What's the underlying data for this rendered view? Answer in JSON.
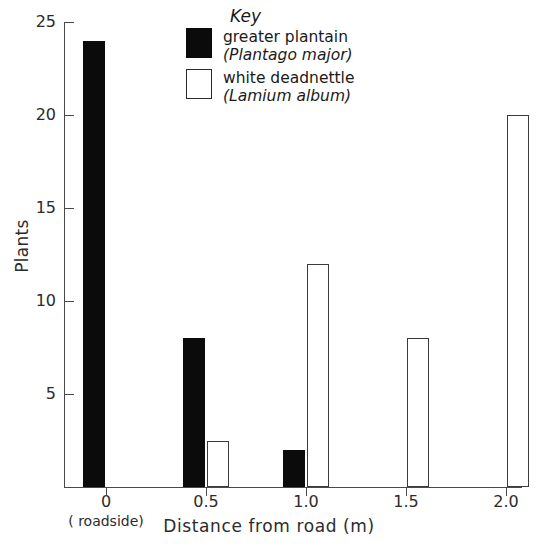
{
  "chart_data": {
    "type": "bar",
    "title": "",
    "xlabel": "Distance from road (m)",
    "ylabel": "Plants",
    "categories": [
      "0",
      "0.5",
      "1.0",
      "1.5",
      "2.0"
    ],
    "x_tick_labels": [
      "0",
      "0.5",
      "1.0",
      "1.5",
      "2.0"
    ],
    "x_axis_note": "( roadside)",
    "y_tick_labels": [
      "5",
      "10",
      "15",
      "20",
      "25"
    ],
    "y_ticks": [
      5,
      10,
      15,
      20,
      25
    ],
    "ylim": [
      0,
      25
    ],
    "grid": false,
    "legend_position": "top-center",
    "series": [
      {
        "name": "greater plantain",
        "latin": "(Plantago major)",
        "fill": "#0b0b0b",
        "style": "filled",
        "values": [
          24,
          8,
          2,
          0,
          0
        ]
      },
      {
        "name": "white deadnettle",
        "latin": "(Lamium album)",
        "fill": "#ffffff",
        "style": "open",
        "values": [
          0,
          2.5,
          12,
          8,
          20
        ]
      }
    ]
  },
  "legend": {
    "title": "Key",
    "entries": [
      {
        "label": "greater plantain",
        "latin": "(Plantago major)",
        "swatch": "filled-square-icon"
      },
      {
        "label": "white deadnettle",
        "latin": "(Lamium album)",
        "swatch": "open-square-icon"
      }
    ]
  },
  "axes": {
    "y_title": "Plants",
    "x_title": "Distance from road (m)",
    "roadside_note": "( roadside)"
  },
  "colors": {
    "ink": "#1a1a1a",
    "axis": "#4a4a4a",
    "bar_filled": "#0b0b0b",
    "bar_open_border": "#3a3a3a",
    "background": "#ffffff"
  }
}
